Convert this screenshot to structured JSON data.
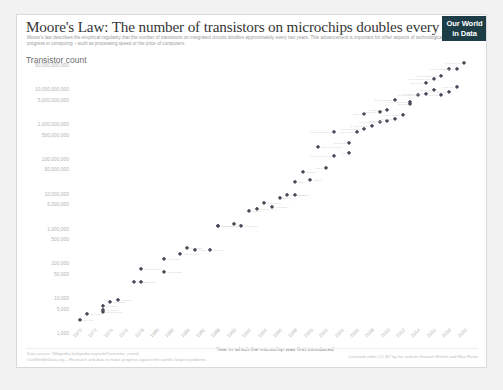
{
  "header": {
    "title": "Moore's Law: The number of transistors on microchips doubles every two years",
    "subtitle": "Moore's law describes the empirical regularity that the number of transistors on integrated circuits doubles approximately every two years. This advancement is important for other aspects of technological progress in computing – such as processing speed or the price of computers.",
    "logo_line1": "Our World",
    "logo_line2": "in Data",
    "logo_color": "#1d3d47"
  },
  "footer": {
    "source": "Data source: Wikipedia (wikipedia.org/wiki/Transistor_count)",
    "org": "OurWorldInData.org – Research and data to make progress against the world's largest problems.",
    "license": "Licensed under CC-BY by the authors Hannah Ritchie and Max Roser."
  },
  "chart_data": {
    "type": "scatter",
    "title": "Moore's Law: The number of transistors on microchips doubles every two years",
    "ylabel": "Transistor count",
    "xlabel": "Year in which the microchip was first introduced",
    "xlim": [
      1970,
      2022
    ],
    "ylim": [
      1000,
      50000000000
    ],
    "yscale": "log",
    "grid": false,
    "legend": "none",
    "marker_color": "#4a4a58",
    "ytick_labels": [
      "50,000,000,000",
      "10,000,000,000",
      "5,000,000,000",
      "1,000,000,000",
      "500,000,000",
      "100,000,000",
      "50,000,000",
      "10,000,000",
      "5,000,000",
      "1,000,000",
      "500,000",
      "100,000",
      "50,000",
      "10,000",
      "5,000",
      "1,000"
    ],
    "ytick_values": [
      50000000000,
      10000000000,
      5000000000,
      1000000000,
      500000000,
      100000000,
      50000000,
      10000000,
      5000000,
      1000000,
      500000,
      100000,
      50000,
      10000,
      5000,
      1000
    ],
    "xtick_labels": [
      "1970",
      "1972",
      "1974",
      "1976",
      "1978",
      "1980",
      "1982",
      "1984",
      "1986",
      "1988",
      "1990",
      "1992",
      "1994",
      "1996",
      "1998",
      "2000",
      "2002",
      "2004",
      "2006",
      "2008",
      "2010",
      "2012",
      "2014",
      "2016",
      "2018",
      "2020"
    ],
    "points": [
      {
        "x": 1971,
        "y": 2300,
        "label": "Intel 4004"
      },
      {
        "x": 1972,
        "y": 3500,
        "label": "Intel 8008"
      },
      {
        "x": 1974,
        "y": 4100,
        "label": "Motorola 6800"
      },
      {
        "x": 1974,
        "y": 6000,
        "label": "Intel 8080"
      },
      {
        "x": 1974,
        "y": 4500,
        "label": "MOS 6502"
      },
      {
        "x": 1975,
        "y": 8000,
        "label": "RCA 1802"
      },
      {
        "x": 1976,
        "y": 9000,
        "label": "Zilog Z80"
      },
      {
        "x": 1978,
        "y": 29000,
        "label": "Intel 8086"
      },
      {
        "x": 1979,
        "y": 29000,
        "label": "Intel 8088"
      },
      {
        "x": 1979,
        "y": 68000,
        "label": "Motorola 68000"
      },
      {
        "x": 1982,
        "y": 134000,
        "label": "Intel 80286"
      },
      {
        "x": 1982,
        "y": 55000,
        "label": "WDC 65C02"
      },
      {
        "x": 1984,
        "y": 190000,
        "label": "Motorola 68020"
      },
      {
        "x": 1985,
        "y": 275000,
        "label": "Intel 80386"
      },
      {
        "x": 1986,
        "y": 250000,
        "label": "ARM 2"
      },
      {
        "x": 1988,
        "y": 250000,
        "label": "Intel i960"
      },
      {
        "x": 1989,
        "y": 1180000,
        "label": "Intel 80486"
      },
      {
        "x": 1989,
        "y": 1200000,
        "label": "Motorola 68040"
      },
      {
        "x": 1991,
        "y": 1350000,
        "label": "ARM 6"
      },
      {
        "x": 1992,
        "y": 1200000,
        "label": "Alpha 21064"
      },
      {
        "x": 1993,
        "y": 3100000,
        "label": "Pentium"
      },
      {
        "x": 1994,
        "y": 3600000,
        "label": "PowerPC 604"
      },
      {
        "x": 1995,
        "y": 5500000,
        "label": "Pentium Pro"
      },
      {
        "x": 1996,
        "y": 4300000,
        "label": "Alpha 21164"
      },
      {
        "x": 1997,
        "y": 7500000,
        "label": "Pentium II"
      },
      {
        "x": 1998,
        "y": 9300000,
        "label": "PowerPC 750"
      },
      {
        "x": 1999,
        "y": 9500000,
        "label": "Pentium III"
      },
      {
        "x": 1999,
        "y": 21300000,
        "label": "Athlon"
      },
      {
        "x": 2000,
        "y": 42000000,
        "label": "Pentium 4"
      },
      {
        "x": 2001,
        "y": 25000000,
        "label": "Itanium"
      },
      {
        "x": 2002,
        "y": 220000000,
        "label": "Itanium 2 McKinley"
      },
      {
        "x": 2003,
        "y": 54000000,
        "label": "Barton"
      },
      {
        "x": 2004,
        "y": 125000000,
        "label": "Pentium 4 Prescott"
      },
      {
        "x": 2004,
        "y": 592000000,
        "label": "Itanium 2 Madison"
      },
      {
        "x": 2006,
        "y": 291000000,
        "label": "Core 2 Duo"
      },
      {
        "x": 2006,
        "y": 151000000,
        "label": "Cell"
      },
      {
        "x": 2007,
        "y": 582000000,
        "label": "Core 2 Quad"
      },
      {
        "x": 2008,
        "y": 731000000,
        "label": "Core i7 Bloomfield"
      },
      {
        "x": 2008,
        "y": 1900000000,
        "label": "Tukwila"
      },
      {
        "x": 2009,
        "y": 904000000,
        "label": "Six-core Opteron"
      },
      {
        "x": 2010,
        "y": 1170000000,
        "label": "Six-core Core i7"
      },
      {
        "x": 2010,
        "y": 2300000000,
        "label": "Nehalem-EX"
      },
      {
        "x": 2011,
        "y": 1200000000,
        "label": "Sandy Bridge"
      },
      {
        "x": 2011,
        "y": 2600000000,
        "label": "Westmere-EX"
      },
      {
        "x": 2012,
        "y": 1400000000,
        "label": "Ivy Bridge"
      },
      {
        "x": 2012,
        "y": 5000000000,
        "label": "Itanium Poulson"
      },
      {
        "x": 2013,
        "y": 1860000000,
        "label": "Xeon Ivy Bridge"
      },
      {
        "x": 2014,
        "y": 4310000000,
        "label": "Xeon Haswell-E5"
      },
      {
        "x": 2014,
        "y": 3800000000,
        "label": "IBM z13"
      },
      {
        "x": 2015,
        "y": 7100000000,
        "label": "Xeon Broadwell"
      },
      {
        "x": 2016,
        "y": 7200000000,
        "label": "Xeon Broadwell-E5"
      },
      {
        "x": 2016,
        "y": 15300000000,
        "label": "SPARC M7"
      },
      {
        "x": 2017,
        "y": 19200000000,
        "label": "Xeon Platinum 8180"
      },
      {
        "x": 2017,
        "y": 9600000000,
        "label": "Zen Epyc"
      },
      {
        "x": 2018,
        "y": 23600000000,
        "label": "Xeon Cascade Lake"
      },
      {
        "x": 2018,
        "y": 6900000000,
        "label": "Apple A12"
      },
      {
        "x": 2019,
        "y": 39540000000,
        "label": "AWS Graviton2"
      },
      {
        "x": 2019,
        "y": 8500000000,
        "label": "Apple A13"
      },
      {
        "x": 2020,
        "y": 11800000000,
        "label": "Apple A14"
      },
      {
        "x": 2020,
        "y": 39540000000,
        "label": "Apple M1"
      },
      {
        "x": 2021,
        "y": 57000000000,
        "label": "Apple M1 Max"
      }
    ]
  }
}
